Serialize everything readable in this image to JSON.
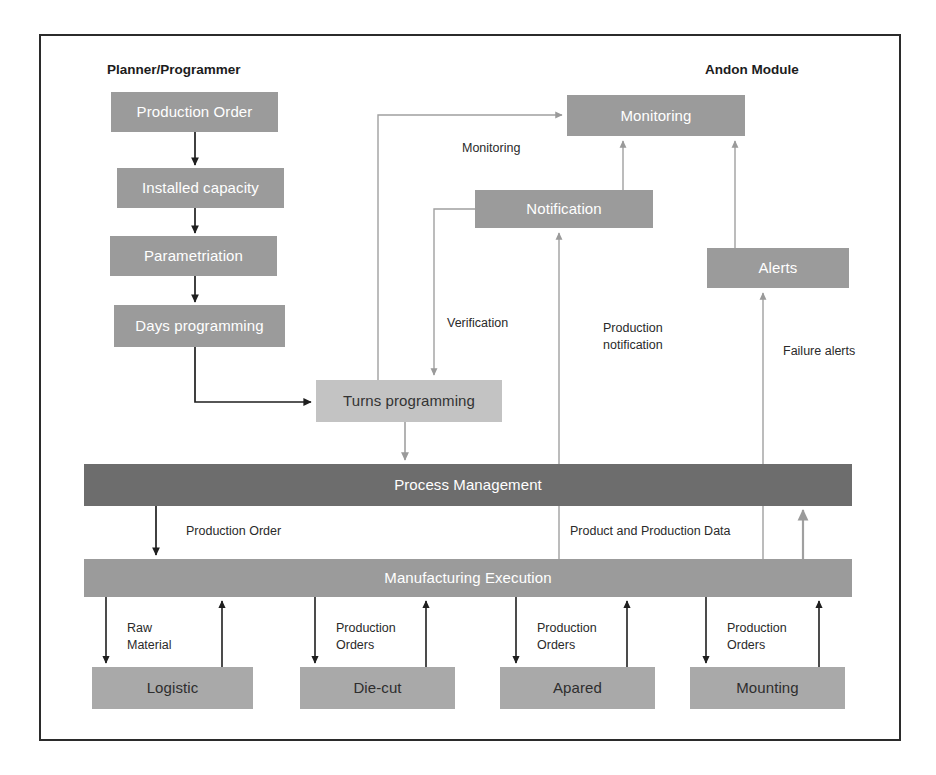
{
  "diagram": {
    "frame": {
      "visible": true,
      "border_color": "#2b2b2b"
    },
    "palette": {
      "node_mid": "#9b9b9b",
      "node_dark": "#6d6d6d",
      "node_light": "#c3c3c3",
      "node_plain": "#a9a9a9",
      "text_light": "#ffffff",
      "text_dark": "#2e2e2e",
      "frame_border": "#2b2b2b",
      "arrow_dark": "#1f1f1f",
      "arrow_light": "#9a9a9a"
    },
    "headings": [
      {
        "id": "planner",
        "label": "Planner/Programmer",
        "x": 107,
        "y": 62
      },
      {
        "id": "andon",
        "label": "Andon Module",
        "x": 705,
        "y": 62
      }
    ],
    "nodes": [
      {
        "id": "production-order",
        "label": "Production Order",
        "x": 111,
        "y": 92,
        "w": 167,
        "h": 40,
        "style": "mid"
      },
      {
        "id": "installed-capacity",
        "label": "Installed capacity",
        "x": 117,
        "y": 168,
        "w": 167,
        "h": 40,
        "style": "mid"
      },
      {
        "id": "parametriation",
        "label": "Parametriation",
        "x": 110,
        "y": 236,
        "w": 167,
        "h": 40,
        "style": "mid"
      },
      {
        "id": "days-programming",
        "label": "Days programming",
        "x": 114,
        "y": 305,
        "w": 171,
        "h": 42,
        "style": "mid"
      },
      {
        "id": "turns-programming",
        "label": "Turns programming",
        "x": 316,
        "y": 380,
        "w": 186,
        "h": 42,
        "style": "light"
      },
      {
        "id": "monitoring",
        "label": "Monitoring",
        "x": 567,
        "y": 95,
        "w": 178,
        "h": 41,
        "style": "mid"
      },
      {
        "id": "notification",
        "label": "Notification",
        "x": 475,
        "y": 190,
        "w": 178,
        "h": 38,
        "style": "mid"
      },
      {
        "id": "alerts",
        "label": "Alerts",
        "x": 707,
        "y": 248,
        "w": 142,
        "h": 40,
        "style": "mid"
      },
      {
        "id": "process-management",
        "label": "Process Management",
        "x": 84,
        "y": 464,
        "w": 768,
        "h": 42,
        "style": "dark"
      },
      {
        "id": "manufacturing-execution",
        "label": "Manufacturing Execution",
        "x": 84,
        "y": 559,
        "w": 768,
        "h": 38,
        "style": "mid"
      },
      {
        "id": "logistic",
        "label": "Logistic",
        "x": 92,
        "y": 667,
        "w": 161,
        "h": 42,
        "style": "plain"
      },
      {
        "id": "die-cut",
        "label": "Die-cut",
        "x": 300,
        "y": 667,
        "w": 155,
        "h": 42,
        "style": "plain"
      },
      {
        "id": "apared",
        "label": "Apared",
        "x": 500,
        "y": 667,
        "w": 155,
        "h": 42,
        "style": "plain"
      },
      {
        "id": "mounting",
        "label": "Mounting",
        "x": 690,
        "y": 667,
        "w": 155,
        "h": 42,
        "style": "plain"
      }
    ],
    "edge_labels": [
      {
        "id": "label-monitoring",
        "label": "Monitoring",
        "x": 462,
        "y": 140
      },
      {
        "id": "label-verification",
        "label": "Verification",
        "x": 447,
        "y": 315
      },
      {
        "id": "label-production-notification",
        "label": "Production\nnotification",
        "x": 603,
        "y": 320
      },
      {
        "id": "label-failure-alerts",
        "label": "Failure alerts",
        "x": 783,
        "y": 343
      },
      {
        "id": "label-production-order",
        "label": "Production Order",
        "x": 186,
        "y": 523
      },
      {
        "id": "label-product-production-data",
        "label": "Product and Production Data",
        "x": 570,
        "y": 523
      },
      {
        "id": "label-raw-material",
        "label": "Raw\nMaterial",
        "x": 127,
        "y": 620
      },
      {
        "id": "label-production-orders-1",
        "label": "Production\nOrders",
        "x": 336,
        "y": 620
      },
      {
        "id": "label-production-orders-2",
        "label": "Production\nOrders",
        "x": 537,
        "y": 620
      },
      {
        "id": "label-production-orders-3",
        "label": "Production\nOrders",
        "x": 727,
        "y": 620
      }
    ],
    "edges": [
      {
        "id": "edge-production-order-to-installed-capacity",
        "from": "production-order",
        "to": "installed-capacity",
        "tone": "dark"
      },
      {
        "id": "edge-installed-capacity-to-parametriation",
        "from": "installed-capacity",
        "to": "parametriation",
        "tone": "dark"
      },
      {
        "id": "edge-parametriation-to-days-programming",
        "from": "parametriation",
        "to": "days-programming",
        "tone": "dark"
      },
      {
        "id": "edge-days-programming-to-turns-programming",
        "from": "days-programming",
        "to": "turns-programming",
        "tone": "dark"
      },
      {
        "id": "edge-turns-programming-to-monitoring",
        "from": "turns-programming",
        "to": "monitoring",
        "tone": "light",
        "label": "Monitoring"
      },
      {
        "id": "edge-notification-to-turns-programming",
        "from": "notification",
        "to": "turns-programming",
        "tone": "light",
        "label": "Verification"
      },
      {
        "id": "edge-notification-to-monitoring",
        "from": "notification",
        "to": "monitoring",
        "tone": "light"
      },
      {
        "id": "edge-alerts-to-monitoring",
        "from": "alerts",
        "to": "monitoring",
        "tone": "light"
      },
      {
        "id": "edge-manufacturing-execution-to-notification",
        "from": "manufacturing-execution",
        "to": "notification",
        "tone": "light",
        "label": "Production notification"
      },
      {
        "id": "edge-manufacturing-execution-to-alerts",
        "from": "manufacturing-execution",
        "to": "alerts",
        "tone": "light",
        "label": "Failure alerts"
      },
      {
        "id": "edge-turns-programming-to-process-management",
        "from": "turns-programming",
        "to": "process-management",
        "tone": "light"
      },
      {
        "id": "edge-process-management-to-manufacturing-execution",
        "from": "process-management",
        "to": "manufacturing-execution",
        "tone": "dark",
        "label": "Production Order"
      },
      {
        "id": "edge-manufacturing-execution-to-process-management",
        "from": "manufacturing-execution",
        "to": "process-management",
        "tone": "light",
        "label": "Product and Production Data"
      },
      {
        "id": "edge-manufacturing-execution-to-logistic",
        "from": "manufacturing-execution",
        "to": "logistic",
        "tone": "dark",
        "label": "Raw Material"
      },
      {
        "id": "edge-logistic-to-manufacturing-execution",
        "from": "logistic",
        "to": "manufacturing-execution",
        "tone": "dark"
      },
      {
        "id": "edge-manufacturing-execution-to-die-cut",
        "from": "manufacturing-execution",
        "to": "die-cut",
        "tone": "dark",
        "label": "Production Orders"
      },
      {
        "id": "edge-die-cut-to-manufacturing-execution",
        "from": "die-cut",
        "to": "manufacturing-execution",
        "tone": "dark"
      },
      {
        "id": "edge-manufacturing-execution-to-apared",
        "from": "manufacturing-execution",
        "to": "apared",
        "tone": "dark",
        "label": "Production Orders"
      },
      {
        "id": "edge-apared-to-manufacturing-execution",
        "from": "apared",
        "to": "manufacturing-execution",
        "tone": "dark"
      },
      {
        "id": "edge-manufacturing-execution-to-mounting",
        "from": "manufacturing-execution",
        "to": "mounting",
        "tone": "dark",
        "label": "Production Orders"
      },
      {
        "id": "edge-mounting-to-manufacturing-execution",
        "from": "mounting",
        "to": "manufacturing-execution",
        "tone": "dark"
      }
    ]
  }
}
